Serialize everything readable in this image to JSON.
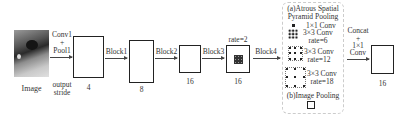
{
  "input": {
    "label": "Image"
  },
  "stem": {
    "line1": "Conv1",
    "line2": "+",
    "line3": "Pool1",
    "note1": "output",
    "note2": "stride"
  },
  "stages": [
    {
      "arrow_label": "Block1",
      "stride": "4"
    },
    {
      "arrow_label": "Block2",
      "stride": "8"
    },
    {
      "arrow_label": "Block3",
      "stride": "16"
    },
    {
      "arrow_label": "Block4",
      "stride": "16",
      "top_label": "rate=2"
    }
  ],
  "aspp": {
    "title_a1": "(a)Atrous Spatial",
    "title_a2": "Pyramid Pooling",
    "branches": [
      {
        "name": "1×1 Conv"
      },
      {
        "name": "3×3 Conv",
        "rate": "rate=6"
      },
      {
        "name": "3×3 Conv",
        "rate": "rate=12"
      },
      {
        "name": "3×3 Conv",
        "rate": "rate=18"
      }
    ],
    "title_b": "(b)Image Pooling"
  },
  "fusion": {
    "line1": "Concat",
    "line2": "+",
    "line3": "1×1",
    "line4": "Conv",
    "stride": "16"
  }
}
